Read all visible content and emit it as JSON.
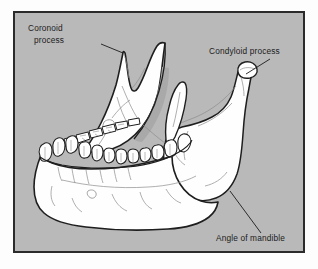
{
  "figure": {
    "subject": "mandible",
    "style": "line-drawing",
    "background_color": "#b9b9b9",
    "frame_color": "#2b2b2b",
    "page_color": "#fdfdfd",
    "bone_fill": "#fefefe",
    "outline_color": "#1e1e1e",
    "detail_line_color": "#8d8d8d",
    "label_color": "#1b1b1b"
  },
  "labels": [
    {
      "id": "coronoid-process",
      "lines": [
        "Coronoid",
        "process"
      ],
      "line1": "Coronoid",
      "line2": "process",
      "text_x": 28,
      "text_y": 31,
      "anchor": "start",
      "leader_from_x": 101,
      "leader_from_y": 44,
      "leader_to_x": 123,
      "leader_to_y": 53
    },
    {
      "id": "condyloid-process",
      "lines": [
        "Condyloid process"
      ],
      "line1": "Condyloid process",
      "line2": "",
      "text_x": 209,
      "text_y": 54,
      "anchor": "start",
      "leader_from_x": 270,
      "leader_from_y": 59,
      "leader_to_x": 246,
      "leader_to_y": 74
    },
    {
      "id": "angle-of-mandible",
      "lines": [
        "Angle of mandible"
      ],
      "line1": "Angle of mandible",
      "line2": "",
      "text_x": 216,
      "text_y": 241,
      "anchor": "start",
      "leader_from_x": 261,
      "leader_from_y": 233,
      "leader_to_x": 230,
      "leader_to_y": 191
    }
  ],
  "frame": {
    "x": 13,
    "y": 11,
    "width": 292,
    "height": 242,
    "stroke_width": 2
  },
  "teeth": {
    "near_arch_count": 13,
    "far_arch_count": 6,
    "description": "Lower dental arcade, near row of incisors, canines, premolars and molars with a receding far row"
  }
}
